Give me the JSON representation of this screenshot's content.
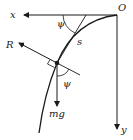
{
  "diagram": {
    "type": "physics-free-body",
    "labels": {
      "origin": "O",
      "x_axis": "x",
      "y_axis": "y",
      "normal_force": "R",
      "weight": "mg",
      "arc_length": "s",
      "angle_top": "ψ",
      "angle_bottom": "ψ"
    },
    "colors": {
      "stroke": "#1a1a1a",
      "background": "#ffffff"
    }
  }
}
